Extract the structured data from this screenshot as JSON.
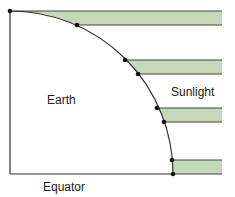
{
  "diagram": {
    "labels": {
      "earth": "Earth",
      "sunlight": "Sunlight",
      "equator": "Equator"
    },
    "colors": {
      "band_fill": "#c3d9b8",
      "band_stroke": "#4a4a4a",
      "line": "#333333",
      "dot": "#111111"
    },
    "bands": [
      {
        "name": "sunlight-band-1",
        "y_top": 11,
        "y_bottom": 25
      },
      {
        "name": "sunlight-band-2",
        "y_top": 60,
        "y_bottom": 74
      },
      {
        "name": "sunlight-band-3",
        "y_top": 108,
        "y_bottom": 122
      },
      {
        "name": "sunlight-band-4",
        "y_top": 160,
        "y_bottom": 174
      }
    ]
  }
}
